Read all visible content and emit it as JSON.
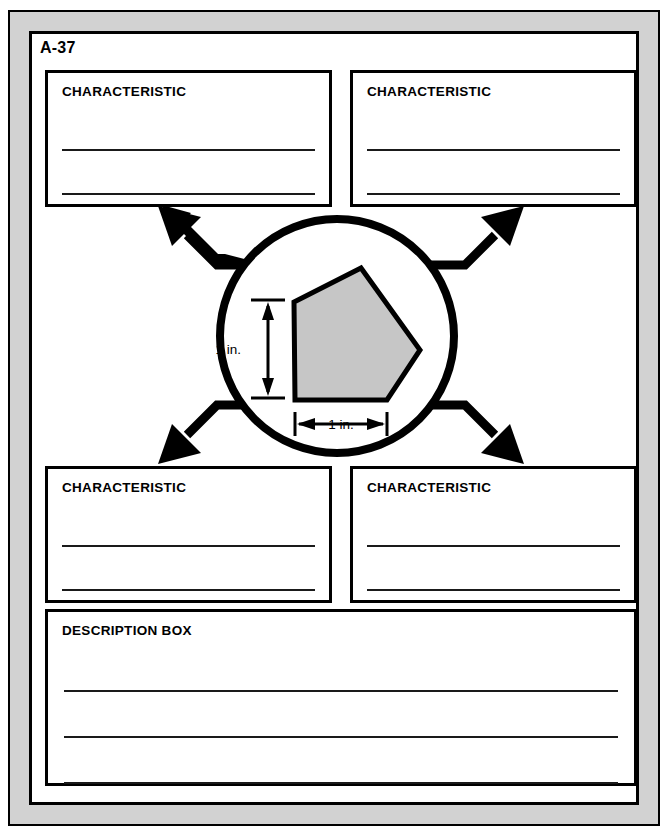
{
  "page": {
    "sheet_code": "A-37",
    "frame_color": "#d2d2d2",
    "border_color": "#000000",
    "background_color": "#ffffff"
  },
  "boxes": {
    "top_left": {
      "title": "CHARACTERISTIC",
      "lines": 2
    },
    "top_right": {
      "title": "CHARACTERISTIC",
      "lines": 2
    },
    "bottom_left": {
      "title": "CHARACTERISTIC",
      "lines": 2
    },
    "bottom_right": {
      "title": "CHARACTERISTIC",
      "lines": 2
    },
    "description": {
      "title": "DESCRIPTION BOX",
      "lines": 3
    }
  },
  "center": {
    "shape_name": "pentagon",
    "shape_fill": "#c6c6c6",
    "shape_stroke": "#000000",
    "circle_stroke": "#000000",
    "dimensions": {
      "vertical_label": "1 in.",
      "horizontal_label": "1 in."
    }
  },
  "connectors": {
    "count": 4,
    "directions": [
      "up-left",
      "up-right",
      "down-left",
      "down-right"
    ],
    "color": "#000000"
  }
}
